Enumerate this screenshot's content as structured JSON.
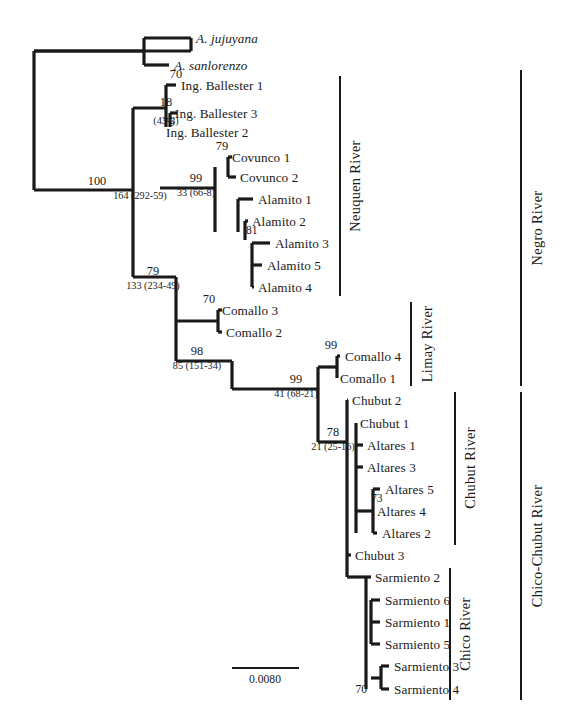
{
  "figure": {
    "type": "phylogenetic-tree",
    "width": 568,
    "height": 723,
    "background_color": "#ffffff",
    "line_color": "#1a1a1a",
    "scale_bar": {
      "label": "0.0080",
      "x1": 232,
      "x2": 299,
      "y": 668,
      "text_x": 265,
      "text_y": 673
    }
  },
  "taxa": [
    {
      "label": "A. jujuyana",
      "x": 196,
      "y": 38,
      "tip_x": 191,
      "italic": true
    },
    {
      "label": "A. sanlorenzo",
      "x": 174,
      "y": 65,
      "tip_x": 169,
      "italic": true
    },
    {
      "label": "Ing. Ballester 1",
      "x": 181,
      "y": 85,
      "tip_x": 176,
      "italic": false
    },
    {
      "label": "Ing. Ballester 3",
      "x": 175,
      "y": 113,
      "tip_x": 170,
      "italic": false
    },
    {
      "label": "Ing. Ballester 2",
      "x": 166,
      "y": 132,
      "tip_x": 162,
      "italic": false
    },
    {
      "label": "Covunco 1",
      "x": 232,
      "y": 157,
      "tip_x": 228,
      "italic": false
    },
    {
      "label": "Covunco 2",
      "x": 240,
      "y": 177,
      "tip_x": 236,
      "italic": false
    },
    {
      "label": "Alamito 1",
      "x": 258,
      "y": 199,
      "tip_x": 253,
      "italic": false
    },
    {
      "label": "Alamito 2",
      "x": 252,
      "y": 221,
      "tip_x": 248,
      "italic": false
    },
    {
      "label": "Alamito 3",
      "x": 275,
      "y": 243,
      "tip_x": 270,
      "italic": false
    },
    {
      "label": "Alamito 5",
      "x": 267,
      "y": 265,
      "tip_x": 262,
      "italic": false
    },
    {
      "label": "Alamito 4",
      "x": 258,
      "y": 287,
      "tip_x": 254,
      "italic": false
    },
    {
      "label": "Comallo 3",
      "x": 222,
      "y": 310,
      "tip_x": 218,
      "italic": false
    },
    {
      "label": "Comallo 2",
      "x": 226,
      "y": 332,
      "tip_x": 222,
      "italic": false
    },
    {
      "label": "Comallo 4",
      "x": 345,
      "y": 356,
      "tip_x": 340,
      "italic": false
    },
    {
      "label": "Comallo 1",
      "x": 340,
      "y": 378,
      "tip_x": 336,
      "italic": false
    },
    {
      "label": "Chubut 2",
      "x": 352,
      "y": 400,
      "tip_x": 348,
      "italic": false
    },
    {
      "label": "Chubut 1",
      "x": 360,
      "y": 423,
      "tip_x": 356,
      "italic": false
    },
    {
      "label": "Altares 1",
      "x": 367,
      "y": 445,
      "tip_x": 362,
      "italic": false
    },
    {
      "label": "Altares 3",
      "x": 367,
      "y": 467,
      "tip_x": 362,
      "italic": false
    },
    {
      "label": "Altares 5",
      "x": 385,
      "y": 489,
      "tip_x": 380,
      "italic": false
    },
    {
      "label": "Altares 4",
      "x": 377,
      "y": 511,
      "tip_x": 373,
      "italic": false
    },
    {
      "label": "Altares 2",
      "x": 382,
      "y": 533,
      "tip_x": 377,
      "italic": false
    },
    {
      "label": "Chubut 3",
      "x": 355,
      "y": 555,
      "tip_x": 351,
      "italic": false
    },
    {
      "label": "Sarmiento 2",
      "x": 375,
      "y": 577,
      "tip_x": 371,
      "italic": false
    },
    {
      "label": "Sarmiento 6",
      "x": 385,
      "y": 600,
      "tip_x": 380,
      "italic": false
    },
    {
      "label": "Sarmiento 1",
      "x": 385,
      "y": 622,
      "tip_x": 380,
      "italic": false
    },
    {
      "label": "Sarmiento 5",
      "x": 385,
      "y": 644,
      "tip_x": 380,
      "italic": false
    },
    {
      "label": "Sarmiento 3",
      "x": 394,
      "y": 666,
      "tip_x": 389,
      "italic": false
    },
    {
      "label": "Sarmiento 4",
      "x": 394,
      "y": 689,
      "tip_x": 389,
      "italic": false
    }
  ],
  "support_values": [
    {
      "value": "70",
      "x": 176,
      "y": 80,
      "style": "top"
    },
    {
      "value": "18",
      "x": 166,
      "y": 108,
      "style": "top"
    },
    {
      "value": "76",
      "x": 163,
      "y": 122,
      "style": "inline"
    },
    {
      "value": "100",
      "x": 97,
      "y": 187,
      "style": "top"
    },
    {
      "value": "79",
      "x": 222,
      "y": 152,
      "style": "top"
    },
    {
      "value": "99",
      "x": 196,
      "y": 184,
      "style": "top"
    },
    {
      "value": "81",
      "x": 246,
      "y": 230,
      "style": "inline"
    },
    {
      "value": "79",
      "x": 153,
      "y": 277,
      "style": "top"
    },
    {
      "value": "70",
      "x": 209,
      "y": 305,
      "style": "top"
    },
    {
      "value": "98",
      "x": 197,
      "y": 357,
      "style": "top"
    },
    {
      "value": "99",
      "x": 331,
      "y": 351,
      "style": "top"
    },
    {
      "value": "99",
      "x": 296,
      "y": 385,
      "style": "top"
    },
    {
      "value": "78",
      "x": 333,
      "y": 438,
      "style": "top"
    },
    {
      "value": "73",
      "x": 371,
      "y": 498,
      "style": "inline"
    },
    {
      "value": "70",
      "x": 367,
      "y": 689,
      "style": "inline-left"
    }
  ],
  "branch_stats": [
    {
      "value": "164 (292-59)",
      "x": 140,
      "y": 191
    },
    {
      "value": "(43-3)",
      "x": 166,
      "y": 116
    },
    {
      "value": "33 (66-8)",
      "x": 196,
      "y": 188
    },
    {
      "value": "133 (234-49)",
      "x": 153,
      "y": 281
    },
    {
      "value": "85 (151-34)",
      "x": 197,
      "y": 361
    },
    {
      "value": "41 (68-21)",
      "x": 296,
      "y": 389
    },
    {
      "value": "21 (25-16)",
      "x": 333,
      "y": 442
    }
  ],
  "river_labels": [
    {
      "label": "Neuquen River",
      "bar_x": 340,
      "bar_y1": 76,
      "bar_y2": 296,
      "text_x": 355,
      "text_cy": 186
    },
    {
      "label": "Limay River",
      "bar_x": 411,
      "bar_y1": 302,
      "bar_y2": 386,
      "text_x": 427,
      "text_cy": 344
    },
    {
      "label": "Chubut River",
      "bar_x": 455,
      "bar_y1": 392,
      "bar_y2": 545,
      "text_x": 470,
      "text_cy": 468
    },
    {
      "label": "Chico River",
      "bar_x": 450,
      "bar_y1": 568,
      "bar_y2": 700,
      "text_x": 465,
      "text_cy": 634
    },
    {
      "label": "Negro River",
      "bar_x": 521,
      "bar_y1": 70,
      "bar_y2": 386,
      "text_x": 537,
      "text_cy": 228
    },
    {
      "label": "Chico-Chubut River",
      "bar_x": 521,
      "bar_y1": 392,
      "bar_y2": 700,
      "text_x": 537,
      "text_cy": 546
    }
  ],
  "edges": [
    {
      "name": "root-vertical",
      "x1": 34,
      "y1": 51,
      "x2": 34,
      "y2": 190,
      "w": 3.2
    },
    {
      "name": "root-to-jujuyana",
      "x1": 34,
      "y1": 51,
      "x2": 191,
      "y2": 51,
      "w": 3.2
    },
    {
      "name": "jujuyana-stub-v",
      "x1": 191,
      "y1": 51,
      "x2": 191,
      "y2": 38,
      "w": 3.2
    },
    {
      "name": "jujuyana-tip",
      "x1": 191,
      "y1": 38,
      "x2": 191,
      "y2": 38,
      "w": 3.2
    },
    {
      "name": "jujuyana-branch",
      "x1": 144,
      "y1": 38,
      "x2": 191,
      "y2": 38,
      "w": 3.2
    },
    {
      "name": "sanlorenzo-branch",
      "x1": 144,
      "y1": 65,
      "x2": 169,
      "y2": 65,
      "w": 3.2
    },
    {
      "name": "outgroup-vertical",
      "x1": 144,
      "y1": 38,
      "x2": 144,
      "y2": 65,
      "w": 3.2
    },
    {
      "name": "outgroup-stem",
      "x1": 34,
      "y1": 51,
      "x2": 144,
      "y2": 51,
      "w": 3.2
    },
    {
      "name": "ballester-node-v",
      "x1": 166,
      "y1": 85,
      "x2": 166,
      "y2": 127,
      "w": 3.2
    },
    {
      "name": "ballester1-branch",
      "x1": 166,
      "y1": 85,
      "x2": 176,
      "y2": 85,
      "w": 3.2
    },
    {
      "name": "ballester32-node-v",
      "x1": 170,
      "y1": 113,
      "x2": 170,
      "y2": 127,
      "w": 3.2
    },
    {
      "name": "ballester3-branch",
      "x1": 170,
      "y1": 113,
      "x2": 177,
      "y2": 113,
      "w": 3.2
    },
    {
      "name": "ballester2-branch",
      "x1": 166,
      "y1": 132,
      "x2": 166,
      "y2": 132,
      "w": 3.2
    },
    {
      "name": "ingball-stem",
      "x1": 133,
      "y1": 108,
      "x2": 166,
      "y2": 108,
      "w": 3.2
    },
    {
      "name": "neuquen-backbone-v",
      "x1": 133,
      "y1": 108,
      "x2": 133,
      "y2": 277,
      "w": 3.2
    },
    {
      "name": "node100-h",
      "x1": 34,
      "y1": 190,
      "x2": 133,
      "y2": 190,
      "w": 3.2
    },
    {
      "name": "covunco-node-v",
      "x1": 228,
      "y1": 157,
      "x2": 228,
      "y2": 177,
      "w": 3.2
    },
    {
      "name": "covunco1-branch",
      "x1": 228,
      "y1": 157,
      "x2": 232,
      "y2": 157,
      "w": 3.2
    },
    {
      "name": "covunco2-branch",
      "x1": 228,
      "y1": 177,
      "x2": 236,
      "y2": 177,
      "w": 3.2
    },
    {
      "name": "clade99a-v",
      "x1": 215,
      "y1": 167,
      "x2": 215,
      "y2": 232,
      "w": 3.2
    },
    {
      "name": "clade99a-stem",
      "x1": 160,
      "y1": 188,
      "x2": 215,
      "y2": 188,
      "w": 3.2
    },
    {
      "name": "alamito1-branch",
      "x1": 238,
      "y1": 199,
      "x2": 253,
      "y2": 199,
      "w": 3.2
    },
    {
      "name": "alamito-node-v",
      "x1": 238,
      "y1": 199,
      "x2": 238,
      "y2": 232,
      "w": 3.2
    },
    {
      "name": "alamito2-branch",
      "x1": 245,
      "y1": 221,
      "x2": 248,
      "y2": 221,
      "w": 3.2
    },
    {
      "name": "alamito2-v",
      "x1": 245,
      "y1": 221,
      "x2": 245,
      "y2": 240,
      "w": 3.2
    },
    {
      "name": "alamito345-v",
      "x1": 252,
      "y1": 243,
      "x2": 252,
      "y2": 287,
      "w": 3.2
    },
    {
      "name": "alamito3-branch",
      "x1": 252,
      "y1": 243,
      "x2": 270,
      "y2": 243,
      "w": 3.2
    },
    {
      "name": "alamito5-branch",
      "x1": 252,
      "y1": 265,
      "x2": 262,
      "y2": 265,
      "w": 3.2
    },
    {
      "name": "alamito4-branch",
      "x1": 252,
      "y1": 287,
      "x2": 254,
      "y2": 287,
      "w": 3.2
    },
    {
      "name": "node79b-h",
      "x1": 133,
      "y1": 277,
      "x2": 176,
      "y2": 277,
      "w": 3.2
    },
    {
      "name": "lower-backbone-v",
      "x1": 176,
      "y1": 277,
      "x2": 176,
      "y2": 361,
      "w": 3.2
    },
    {
      "name": "comallo32-v",
      "x1": 218,
      "y1": 310,
      "x2": 218,
      "y2": 332,
      "w": 3.2
    },
    {
      "name": "comallo3-branch",
      "x1": 218,
      "y1": 310,
      "x2": 222,
      "y2": 310,
      "w": 3.2
    },
    {
      "name": "comallo2-branch",
      "x1": 218,
      "y1": 332,
      "x2": 222,
      "y2": 332,
      "w": 3.2
    },
    {
      "name": "comallo-stem",
      "x1": 176,
      "y1": 321,
      "x2": 218,
      "y2": 321,
      "w": 3.2
    },
    {
      "name": "node98-h",
      "x1": 176,
      "y1": 361,
      "x2": 232,
      "y2": 361,
      "w": 3.2
    },
    {
      "name": "node99b-v",
      "x1": 232,
      "y1": 361,
      "x2": 232,
      "y2": 389,
      "w": 3.2
    },
    {
      "name": "node99b-h",
      "x1": 232,
      "y1": 389,
      "x2": 318,
      "y2": 389,
      "w": 3.2
    },
    {
      "name": "limay-chubut-v",
      "x1": 318,
      "y1": 367,
      "x2": 318,
      "y2": 442,
      "w": 3.2
    },
    {
      "name": "comallo41-v",
      "x1": 337,
      "y1": 356,
      "x2": 337,
      "y2": 378,
      "w": 3.2
    },
    {
      "name": "comallo4-branch",
      "x1": 337,
      "y1": 356,
      "x2": 340,
      "y2": 356,
      "w": 3.2
    },
    {
      "name": "comallo1-branch",
      "x1": 337,
      "y1": 378,
      "x2": 337,
      "y2": 378,
      "w": 3.2
    },
    {
      "name": "comallo41-stem",
      "x1": 318,
      "y1": 367,
      "x2": 337,
      "y2": 367,
      "w": 3.2
    },
    {
      "name": "node78-h",
      "x1": 318,
      "y1": 442,
      "x2": 347,
      "y2": 442,
      "w": 3.2
    },
    {
      "name": "chubut-backbone-v",
      "x1": 347,
      "y1": 400,
      "x2": 347,
      "y2": 577,
      "w": 3.2
    },
    {
      "name": "chubut2-branch",
      "x1": 347,
      "y1": 400,
      "x2": 348,
      "y2": 400,
      "w": 3.2
    },
    {
      "name": "chubut1-v",
      "x1": 356,
      "y1": 423,
      "x2": 356,
      "y2": 533,
      "w": 3.2
    },
    {
      "name": "chubut1-branch",
      "x1": 356,
      "y1": 423,
      "x2": 356,
      "y2": 423,
      "w": 3.2
    },
    {
      "name": "altares1-branch",
      "x1": 356,
      "y1": 445,
      "x2": 363,
      "y2": 445,
      "w": 3.2
    },
    {
      "name": "altares3-branch",
      "x1": 356,
      "y1": 467,
      "x2": 363,
      "y2": 467,
      "w": 3.2
    },
    {
      "name": "altares542-v",
      "x1": 373,
      "y1": 489,
      "x2": 373,
      "y2": 533,
      "w": 3.2
    },
    {
      "name": "altares542-stem",
      "x1": 356,
      "y1": 511,
      "x2": 373,
      "y2": 511,
      "w": 3.2
    },
    {
      "name": "altares5-branch",
      "x1": 373,
      "y1": 489,
      "x2": 380,
      "y2": 489,
      "w": 3.2
    },
    {
      "name": "altares4-branch",
      "x1": 373,
      "y1": 511,
      "x2": 373,
      "y2": 511,
      "w": 3.2
    },
    {
      "name": "altares2-branch",
      "x1": 373,
      "y1": 533,
      "x2": 377,
      "y2": 533,
      "w": 3.2
    },
    {
      "name": "chubut3-branch",
      "x1": 347,
      "y1": 555,
      "x2": 351,
      "y2": 555,
      "w": 3.2
    },
    {
      "name": "sarmiento-backbone-v",
      "x1": 366,
      "y1": 577,
      "x2": 366,
      "y2": 689,
      "w": 3.2
    },
    {
      "name": "sarmiento-stem",
      "x1": 347,
      "y1": 577,
      "x2": 366,
      "y2": 577,
      "w": 3.2
    },
    {
      "name": "sarmiento2-branch",
      "x1": 366,
      "y1": 577,
      "x2": 371,
      "y2": 577,
      "w": 3.2
    },
    {
      "name": "sarmiento6-branch",
      "x1": 371,
      "y1": 600,
      "x2": 380,
      "y2": 600,
      "w": 3.2
    },
    {
      "name": "sarmiento651-v",
      "x1": 371,
      "y1": 600,
      "x2": 371,
      "y2": 644,
      "w": 3.2
    },
    {
      "name": "sarmiento1-branch",
      "x1": 371,
      "y1": 622,
      "x2": 380,
      "y2": 622,
      "w": 3.2
    },
    {
      "name": "sarmiento5-branch",
      "x1": 371,
      "y1": 644,
      "x2": 380,
      "y2": 644,
      "w": 3.2
    },
    {
      "name": "sarmiento34-v",
      "x1": 381,
      "y1": 666,
      "x2": 381,
      "y2": 689,
      "w": 3.2
    },
    {
      "name": "sarmiento34-stem",
      "x1": 371,
      "y1": 678,
      "x2": 381,
      "y2": 678,
      "w": 3.2
    },
    {
      "name": "sarmiento3-branch",
      "x1": 381,
      "y1": 666,
      "x2": 389,
      "y2": 666,
      "w": 3.2
    },
    {
      "name": "sarmiento4-branch",
      "x1": 381,
      "y1": 689,
      "x2": 389,
      "y2": 689,
      "w": 3.2
    }
  ]
}
